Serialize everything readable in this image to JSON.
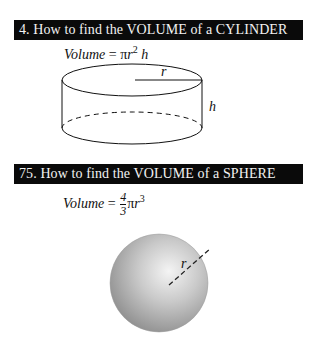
{
  "sections": [
    {
      "heading": "4. How to find the VOLUME of a CYLINDER",
      "formula": {
        "lhs": "Volume",
        "eq": "=",
        "pi": "π",
        "var": "r",
        "exp": "2",
        "tail": "h"
      },
      "diagram": {
        "shape": "cylinder",
        "labels": {
          "radius": "r",
          "height": "h"
        }
      }
    },
    {
      "heading": "75. How to find the VOLUME of a SPHERE",
      "formula": {
        "lhs": "Volume",
        "eq": "=",
        "numerator": "4",
        "denominator": "3",
        "pi": "π",
        "var": "r",
        "exp": "3"
      },
      "diagram": {
        "shape": "sphere",
        "labels": {
          "radius": "r"
        }
      }
    }
  ]
}
